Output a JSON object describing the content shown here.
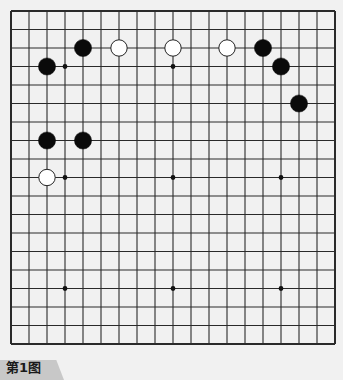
{
  "board": {
    "size": 19,
    "origin_x": 11,
    "origin_y": 11,
    "spacing_x": 18,
    "spacing_y": 18.5,
    "background": "#f1f1f1",
    "line_color": "#2a2a2a",
    "star_points": [
      [
        3,
        3
      ],
      [
        9,
        3
      ],
      [
        15,
        3
      ],
      [
        3,
        9
      ],
      [
        9,
        9
      ],
      [
        15,
        9
      ],
      [
        3,
        15
      ],
      [
        9,
        15
      ],
      [
        15,
        15
      ]
    ],
    "stones": [
      {
        "color": "black",
        "col": 4,
        "row": 2
      },
      {
        "color": "white",
        "col": 6,
        "row": 2
      },
      {
        "color": "white",
        "col": 9,
        "row": 2
      },
      {
        "color": "white",
        "col": 12,
        "row": 2
      },
      {
        "color": "black",
        "col": 14,
        "row": 2
      },
      {
        "color": "black",
        "col": 2,
        "row": 3
      },
      {
        "color": "black",
        "col": 15,
        "row": 3
      },
      {
        "color": "black",
        "col": 16,
        "row": 5
      },
      {
        "color": "black",
        "col": 2,
        "row": 7
      },
      {
        "color": "black",
        "col": 4,
        "row": 7
      },
      {
        "color": "white",
        "col": 2,
        "row": 9
      }
    ],
    "colors": {
      "black": "#0a0a0a",
      "white": "#ffffff",
      "white_outline": "#222222"
    }
  },
  "caption": {
    "label": "第1图"
  }
}
